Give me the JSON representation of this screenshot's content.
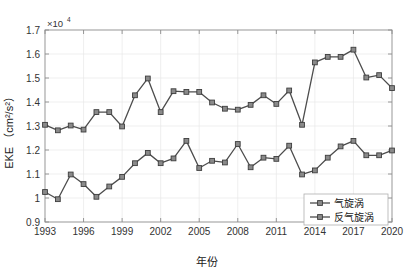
{
  "chart_data": {
    "type": "line",
    "title": "",
    "xlabel": "年份",
    "ylabel": "EKE（cm²/s²）",
    "y_exponent_base": "×10",
    "y_exponent_power": "4",
    "y_multiplier": 10000,
    "xlim": [
      1993,
      2020
    ],
    "ylim": [
      0.9,
      1.7
    ],
    "xticks": [
      1993,
      1996,
      1999,
      2002,
      2005,
      2008,
      2011,
      2014,
      2017,
      2020
    ],
    "yticks": [
      0.9,
      1.0,
      1.1,
      1.2,
      1.3,
      1.4,
      1.5,
      1.6,
      1.7
    ],
    "ytick_labels": [
      "0.9",
      "1",
      "1.1",
      "1.2",
      "1.3",
      "1.4",
      "1.5",
      "1.6",
      "1.7"
    ],
    "xtick_labels": [
      "1993",
      "1996",
      "1999",
      "2002",
      "2005",
      "2008",
      "2011",
      "2014",
      "2017",
      "2020"
    ],
    "grid": true,
    "legend_position": "bottom-right",
    "x": [
      1993,
      1994,
      1995,
      1996,
      1997,
      1998,
      1999,
      2000,
      2001,
      2002,
      2003,
      2004,
      2005,
      2006,
      2007,
      2008,
      2009,
      2010,
      2011,
      2012,
      2013,
      2014,
      2015,
      2016,
      2017,
      2018,
      2019,
      2020
    ],
    "series": [
      {
        "name": "气旋涡",
        "color": "#4d4d4d",
        "values": [
          1.025,
          0.995,
          1.098,
          1.058,
          1.005,
          1.048,
          1.088,
          1.145,
          1.188,
          1.145,
          1.165,
          1.238,
          1.125,
          1.155,
          1.148,
          1.225,
          1.128,
          1.168,
          1.163,
          1.218,
          1.098,
          1.115,
          1.168,
          1.215,
          1.238,
          1.178,
          1.178,
          1.198
        ]
      },
      {
        "name": "反气旋涡",
        "color": "#4d4d4d",
        "values": [
          1.305,
          1.282,
          1.302,
          1.285,
          1.358,
          1.358,
          1.298,
          1.428,
          1.498,
          1.358,
          1.445,
          1.442,
          1.442,
          1.398,
          1.372,
          1.368,
          1.388,
          1.428,
          1.392,
          1.448,
          1.305,
          1.565,
          1.588,
          1.588,
          1.618,
          1.502,
          1.512,
          1.458
        ]
      }
    ]
  },
  "legend": {
    "entries": [
      {
        "label": "气旋涡"
      },
      {
        "label": "反气旋涡"
      }
    ]
  },
  "axes": {
    "x_title": "年份",
    "y_title_main": "EKE",
    "y_title_units": "（cm²/s²）"
  }
}
